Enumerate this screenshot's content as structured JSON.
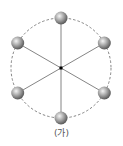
{
  "diagram": {
    "caption": "(가)",
    "center": {
      "x": 61,
      "y": 68
    },
    "radius": 50,
    "colors": {
      "circle": "#666666",
      "spokes": "#777777",
      "sphere_light": "#f2f2f2",
      "sphere_mid": "#a8a8a8",
      "sphere_dark": "#5a5a5a",
      "center_dot": "#000000"
    },
    "spheres": [
      {
        "id": "top",
        "angle_deg": -90
      },
      {
        "id": "upper-right",
        "angle_deg": -30
      },
      {
        "id": "lower-right",
        "angle_deg": 30
      },
      {
        "id": "bottom",
        "angle_deg": 90
      },
      {
        "id": "lower-left",
        "angle_deg": 150
      },
      {
        "id": "upper-left",
        "angle_deg": 210
      }
    ]
  }
}
